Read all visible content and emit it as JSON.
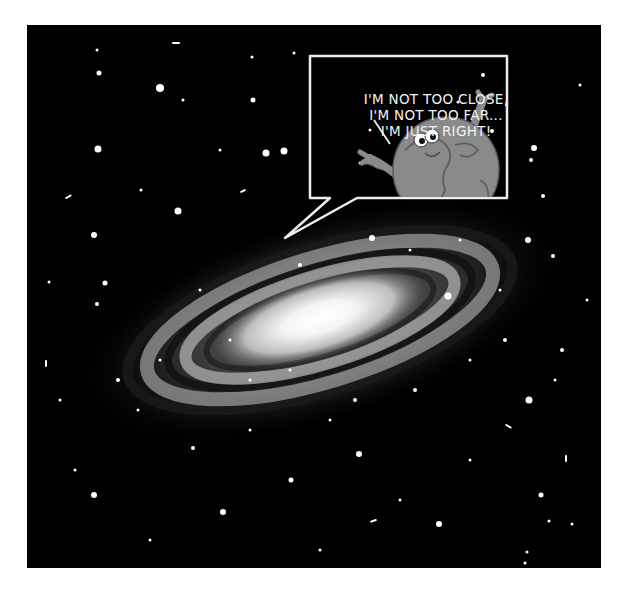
{
  "comic": {
    "speech_bubble": {
      "lines": [
        "I'M NOT TOO CLOSE,",
        "I'M NOT TOO FAR...",
        "I'M JUST RIGHT!"
      ]
    },
    "character": "planet-earth-character",
    "background": "spiral-galaxy-starfield"
  },
  "colors": {
    "page": "#ffffff",
    "space": "#000000",
    "bubble_stroke": "#eeeeee",
    "planet": "#8a8a8a",
    "planet_outline": "#5a5a5a",
    "galaxy_core": "#ffffff"
  }
}
